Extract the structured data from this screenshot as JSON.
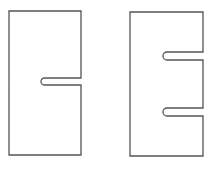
{
  "diagram": {
    "stroke_color": "#555555",
    "background": "#ffffff",
    "shapes": [
      {
        "name": "plate-one-slot",
        "slots": 1,
        "bounds": {
          "x": 9,
          "y": 11,
          "width": 72,
          "height": 144
        },
        "slot_positions_y": [
          [
            78,
            85
          ]
        ],
        "slot_depth_from_x": 41
      },
      {
        "name": "plate-two-slots",
        "slots": 2,
        "bounds": {
          "x": 130,
          "y": 12,
          "width": 73,
          "height": 144
        },
        "slot_positions_y": [
          [
            52,
            60
          ],
          [
            108,
            116
          ]
        ],
        "slot_depth_from_x": 163
      }
    ]
  }
}
